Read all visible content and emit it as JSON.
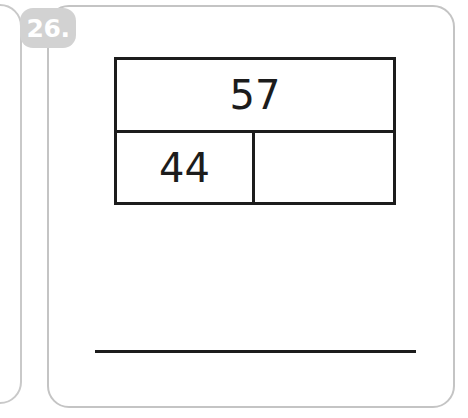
{
  "problem": {
    "number_label": "26.",
    "badge_color": "#d2d2d2",
    "badge_text_color": "#ffffff",
    "card_border_color": "#c4c4c4"
  },
  "bar_model": {
    "whole": {
      "label": "57",
      "name": "whole-cell"
    },
    "parts": [
      {
        "label": "44",
        "name": "part-cell-known"
      },
      {
        "label": "",
        "name": "part-cell-unknown"
      }
    ],
    "line_color": "#1c1c1c"
  },
  "answer": {
    "value": "",
    "line_color": "#1c1c1c"
  },
  "chart_data": {
    "type": "bar",
    "title": "",
    "categories": [
      "whole",
      "part 1",
      "part 2"
    ],
    "values": [
      57,
      44,
      null
    ],
    "xlabel": "",
    "ylabel": "",
    "annotations": [
      "57",
      "44",
      ""
    ]
  }
}
